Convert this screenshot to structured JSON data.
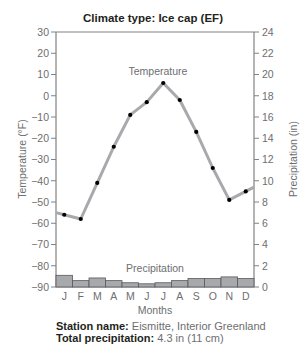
{
  "chart_data": {
    "type": "line+bar",
    "title": "Climate type: Ice cap (EF)",
    "categories": [
      "J",
      "F",
      "M",
      "A",
      "M",
      "J",
      "J",
      "A",
      "S",
      "O",
      "N",
      "D"
    ],
    "xlabel": "Months",
    "ylabel_left": "Temperature (°F)",
    "ylabel_right": "Precipitation (in)",
    "ylim_left": [
      -90,
      30
    ],
    "yticks_left": [
      30,
      20,
      10,
      0,
      -10,
      -20,
      -30,
      -40,
      -50,
      -60,
      -70,
      -80,
      -90
    ],
    "ylim_right": [
      0,
      24
    ],
    "yticks_right": [
      24,
      22,
      20,
      18,
      16,
      14,
      12,
      10,
      8,
      6,
      4,
      2,
      0
    ],
    "grid": false,
    "series": [
      {
        "name": "Temperature",
        "type": "line",
        "axis": "left",
        "color": "#a7a9ac",
        "marker_color": "#000000",
        "values": [
          -56,
          -58,
          -41,
          -24,
          -9,
          -3,
          6,
          -2,
          -17,
          -34,
          -49,
          -45
        ]
      },
      {
        "name": "Precipitation",
        "type": "bar",
        "axis": "right",
        "color": "#a7a9ac",
        "edge_color": "#58595b",
        "values": [
          1.1,
          0.6,
          0.85,
          0.6,
          0.4,
          0.3,
          0.4,
          0.6,
          0.8,
          0.8,
          0.95,
          0.8
        ]
      }
    ],
    "annotations": [
      "Temperature",
      "Precipitation"
    ]
  },
  "footer": {
    "station_label": "Station name:",
    "station_value": "Eismitte, Interior Greenland",
    "total_label": "Total precipitation:",
    "total_value": "4.3 in (11 cm)"
  }
}
